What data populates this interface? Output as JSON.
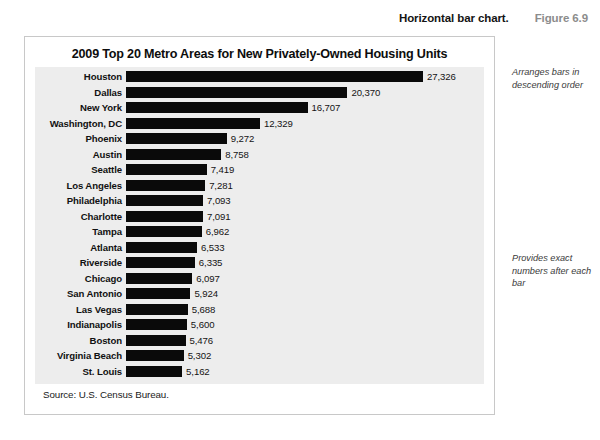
{
  "caption": {
    "text": "Horizontal bar chart.",
    "figure_number": "Figure 6.9"
  },
  "chart_card": {
    "title": "2009 Top 20 Metro Areas for New Privately-Owned Housing Units",
    "source": "Source: U.S. Census Bureau."
  },
  "annotations": [
    {
      "id": "order",
      "text": "Arranges bars in descending order"
    },
    {
      "id": "numbers",
      "text": "Provides exact numbers after each bar"
    }
  ],
  "colors": {
    "bar": "#0a0a0a",
    "plot_background": "#ededed",
    "card_border": "#c8c8c8",
    "figure_number": "#8c8c8c"
  },
  "chart_data": {
    "type": "bar",
    "orientation": "horizontal",
    "title": "2009 Top 20 Metro Areas for New Privately-Owned Housing Units",
    "xlabel": "",
    "ylabel": "",
    "grid": false,
    "legend": null,
    "sorted": "descending",
    "xlim": [
      0,
      27326
    ],
    "categories": [
      "Houston",
      "Dallas",
      "New York",
      "Washington, DC",
      "Phoenix",
      "Austin",
      "Seattle",
      "Los Angeles",
      "Philadelphia",
      "Charlotte",
      "Tampa",
      "Atlanta",
      "Riverside",
      "Chicago",
      "San Antonio",
      "Las Vegas",
      "Indianapolis",
      "Boston",
      "Virginia Beach",
      "St. Louis"
    ],
    "values": [
      27326,
      20370,
      16707,
      12329,
      9272,
      8758,
      7419,
      7281,
      7093,
      7091,
      6962,
      6533,
      6335,
      6097,
      5924,
      5688,
      5600,
      5476,
      5302,
      5162
    ],
    "value_labels": [
      "27,326",
      "20,370",
      "16,707",
      "12,329",
      "9,272",
      "8,758",
      "7,419",
      "7,281",
      "7,093",
      "7,091",
      "6,962",
      "6,533",
      "6,335",
      "6,097",
      "5,924",
      "5,688",
      "5,600",
      "5,476",
      "5,302",
      "5,162"
    ],
    "source": "Source: U.S. Census Bureau."
  }
}
